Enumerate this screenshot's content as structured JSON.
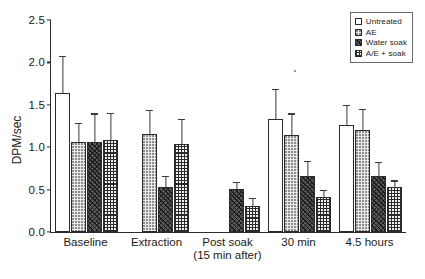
{
  "chart_data": {
    "type": "bar",
    "title": "",
    "xlabel": "",
    "ylabel": "DPM/sec",
    "ylim": [
      0.0,
      2.5
    ],
    "ytick_labels": [
      "0.0",
      "0.5",
      "1.0",
      "1.5",
      "2.0",
      "2.5"
    ],
    "ytick_values": [
      0.0,
      0.5,
      1.0,
      1.5,
      2.0,
      2.5
    ],
    "grid": false,
    "legend_position": "top-right",
    "categories": [
      "Baseline",
      "Extraction",
      "Post soak",
      "30 min",
      "4.5 hours"
    ],
    "category_sublabels": [
      "",
      "",
      "(15 min after)",
      "",
      ""
    ],
    "series": [
      {
        "name": "Untreated",
        "pattern": "open-white",
        "values": [
          1.64,
          null,
          null,
          1.33,
          1.26
        ],
        "errors": [
          0.45,
          null,
          null,
          0.37,
          0.25
        ]
      },
      {
        "name": "AE",
        "pattern": "light-dotted",
        "values": [
          1.06,
          1.15,
          null,
          1.14,
          1.2
        ],
        "errors": [
          0.24,
          0.3,
          null,
          0.27,
          0.26
        ]
      },
      {
        "name": "Water soak",
        "pattern": "dark-diagonal-hatch",
        "values": [
          1.06,
          0.53,
          0.51,
          0.66,
          0.66
        ],
        "errors": [
          0.35,
          0.14,
          0.09,
          0.19,
          0.18
        ]
      },
      {
        "name": "A/E + soak",
        "pattern": "cross-hatch-grid",
        "values": [
          1.09,
          1.04,
          0.31,
          0.41,
          0.53
        ],
        "errors": [
          0.33,
          0.31,
          0.1,
          0.1,
          0.09
        ]
      }
    ]
  },
  "legend": {
    "items": [
      {
        "label": "Untreated"
      },
      {
        "label": "AE"
      },
      {
        "label": "Water soak"
      },
      {
        "label": "A/E  +  soak"
      }
    ]
  },
  "colors": {
    "axis": "#2b2b2b",
    "bar_outline": "#2b2b2b",
    "error_bar": "#3a3a3a",
    "background": "#ffffff"
  }
}
